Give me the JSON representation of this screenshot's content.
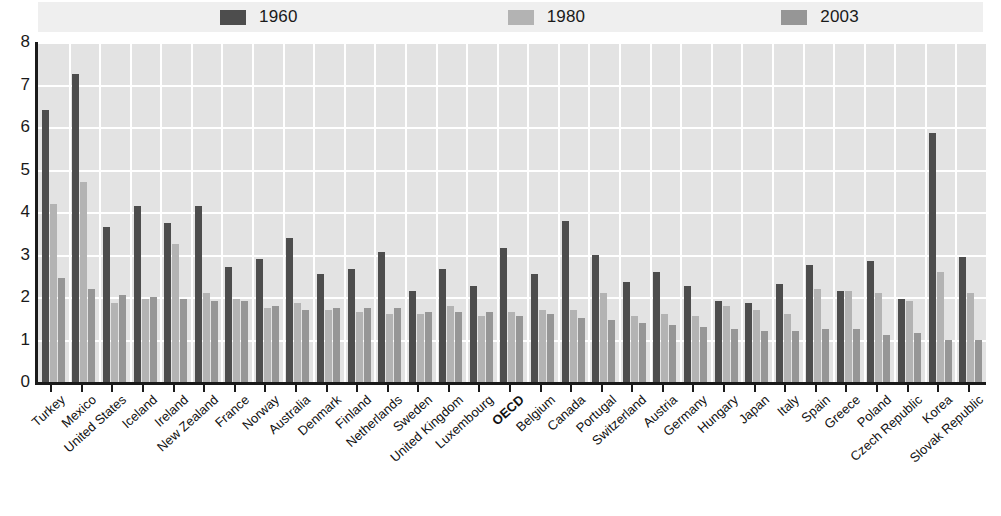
{
  "legend": {
    "items": [
      {
        "label": "1960",
        "color": "#4d4d4d",
        "icon": "legend-swatch-icon"
      },
      {
        "label": "1980",
        "color": "#b3b3b3",
        "icon": "legend-swatch-icon"
      },
      {
        "label": "2003",
        "color": "#969696",
        "icon": "legend-swatch-icon"
      }
    ]
  },
  "chart_data": {
    "type": "bar",
    "title": "",
    "xlabel": "",
    "ylabel": "",
    "ylim": [
      0,
      8
    ],
    "yticks": [
      0,
      1,
      2,
      3,
      4,
      5,
      6,
      7,
      8
    ],
    "ytick_labels": [
      "0",
      "1",
      "2",
      "3",
      "4",
      "5",
      "6",
      "7",
      "8"
    ],
    "grid": true,
    "legend_position": "top",
    "emphasis_category": "OECD",
    "categories": [
      "Turkey",
      "Mexico",
      "United States",
      "Iceland",
      "Ireland",
      "New Zealand",
      "France",
      "Norway",
      "Australia",
      "Denmark",
      "Finland",
      "Netherlands",
      "Sweden",
      "United Kingdom",
      "Luxembourg",
      "OECD",
      "Belgium",
      "Canada",
      "Portugal",
      "Switzerland",
      "Austria",
      "Germany",
      "Hungary",
      "Japan",
      "Italy",
      "Spain",
      "Greece",
      "Poland",
      "Czech Republic",
      "Korea",
      "Slovak Republic"
    ],
    "series": [
      {
        "name": "1960",
        "color": "#4d4d4d",
        "values": [
          6.4,
          7.25,
          3.65,
          4.15,
          3.75,
          4.15,
          2.7,
          2.9,
          3.4,
          2.55,
          2.65,
          3.05,
          2.15,
          2.65,
          2.25,
          3.15,
          2.55,
          3.8,
          3.0,
          2.35,
          2.6,
          2.25,
          1.9,
          1.85,
          2.3,
          2.75,
          2.15,
          2.85,
          1.95,
          5.85,
          2.95
        ]
      },
      {
        "name": "1980",
        "color": "#b3b3b3",
        "values": [
          4.2,
          4.7,
          1.85,
          1.95,
          3.25,
          2.1,
          1.95,
          1.75,
          1.85,
          1.7,
          1.65,
          1.6,
          1.6,
          1.8,
          1.55,
          1.65,
          1.7,
          1.7,
          2.1,
          1.55,
          1.6,
          1.55,
          1.8,
          1.7,
          1.6,
          2.2,
          2.15,
          2.1,
          1.9,
          2.6,
          2.1
        ]
      },
      {
        "name": "2003",
        "color": "#969696",
        "values": [
          2.45,
          2.2,
          2.05,
          2.0,
          1.95,
          1.9,
          1.9,
          1.8,
          1.7,
          1.75,
          1.75,
          1.75,
          1.65,
          1.65,
          1.65,
          1.55,
          1.6,
          1.5,
          1.45,
          1.4,
          1.35,
          1.3,
          1.25,
          1.2,
          1.2,
          1.25,
          1.25,
          1.1,
          1.15,
          1.0,
          1.0
        ]
      }
    ]
  }
}
